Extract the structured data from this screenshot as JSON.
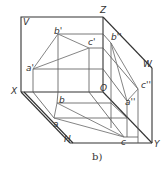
{
  "figure": {
    "caption": "b)",
    "axes": {
      "V": "V",
      "Z": "Z",
      "X": "X",
      "O": "O",
      "W": "W",
      "H": "H",
      "Y": "Y"
    },
    "points": {
      "a_v": "a'",
      "b_v": "b'",
      "c_v": "c'",
      "a_w": "a''",
      "b_w": "b''",
      "c_w": "c''",
      "a_h": "a",
      "b_h": "b",
      "c_h": "c"
    },
    "colors": {
      "frame": "#333333",
      "projection": "#555555",
      "triangle": "#777777"
    }
  }
}
